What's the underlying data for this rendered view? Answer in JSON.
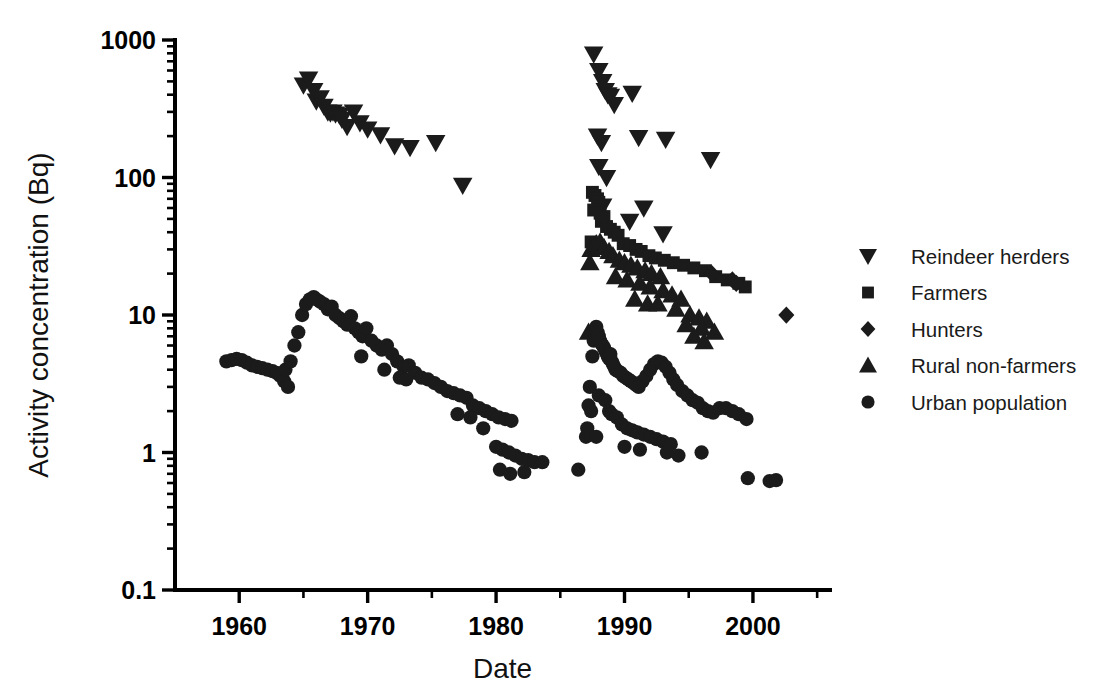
{
  "figure": {
    "background": "#ffffff",
    "ink": "#1b1b1b"
  },
  "axes": {
    "x_title": "Date",
    "y_title": "Activity concentration (Bq)",
    "x_ticklabels": [
      "1960",
      "1970",
      "1980",
      "1990",
      "2000"
    ],
    "y_ticklabels": [
      "0.1",
      "1",
      "10",
      "100",
      "1000"
    ]
  },
  "legend": {
    "position": "right",
    "items": [
      {
        "label": "Reindeer herders",
        "marker": "triangle-down",
        "color": "#1b1b1b"
      },
      {
        "label": "Farmers",
        "marker": "square",
        "color": "#1b1b1b"
      },
      {
        "label": "Hunters",
        "marker": "diamond",
        "color": "#1b1b1b"
      },
      {
        "label": "Rural non-farmers",
        "marker": "triangle-up",
        "color": "#1b1b1b"
      },
      {
        "label": "Urban population",
        "marker": "circle",
        "color": "#1b1b1b"
      }
    ]
  },
  "chart_data": {
    "type": "scatter",
    "title": "",
    "xlabel": "Date",
    "ylabel": "Activity concentration (Bq)",
    "xlim": [
      1955,
      2006
    ],
    "ylim": [
      0.1,
      1000
    ],
    "yscale": "log",
    "xscale": "linear",
    "grid": false,
    "legend_position": "right",
    "x_major_ticks": [
      1960,
      1970,
      1980,
      1990,
      2000
    ],
    "x_minor_ticks": [
      1965,
      1975,
      1985,
      1995,
      2005
    ],
    "y_major_ticks": [
      0.1,
      1,
      10,
      100,
      1000
    ],
    "series": [
      {
        "name": "Reindeer herders",
        "marker": "triangle-down",
        "color": "#1b1b1b",
        "points": [
          [
            1965.0,
            470
          ],
          [
            1965.4,
            520
          ],
          [
            1965.8,
            430
          ],
          [
            1966.0,
            360
          ],
          [
            1966.3,
            380
          ],
          [
            1966.6,
            330
          ],
          [
            1966.9,
            300
          ],
          [
            1967.1,
            295
          ],
          [
            1967.3,
            300
          ],
          [
            1967.5,
            290
          ],
          [
            1967.8,
            285
          ],
          [
            1968.0,
            265
          ],
          [
            1968.4,
            235
          ],
          [
            1968.9,
            300
          ],
          [
            1969.4,
            250
          ],
          [
            1970.0,
            225
          ],
          [
            1971.0,
            205
          ],
          [
            1972.1,
            170
          ],
          [
            1973.3,
            165
          ],
          [
            1975.3,
            180
          ],
          [
            1977.4,
            88
          ],
          [
            1987.6,
            790
          ],
          [
            1988.0,
            600
          ],
          [
            1988.3,
            500
          ],
          [
            1988.5,
            430
          ],
          [
            1988.7,
            400
          ],
          [
            1988.9,
            390
          ],
          [
            1989.2,
            340
          ],
          [
            1990.6,
            410
          ],
          [
            1987.9,
            200
          ],
          [
            1988.2,
            180
          ],
          [
            1991.1,
            195
          ],
          [
            1993.2,
            190
          ],
          [
            1988.0,
            120
          ],
          [
            1988.6,
            100
          ],
          [
            1996.7,
            135
          ],
          [
            1988.3,
            62
          ],
          [
            1991.5,
            60
          ],
          [
            1990.4,
            48
          ],
          [
            1993.0,
            39
          ]
        ]
      },
      {
        "name": "Farmers",
        "marker": "square",
        "color": "#1b1b1b",
        "points": [
          [
            1987.5,
            78
          ],
          [
            1987.7,
            74
          ],
          [
            1987.9,
            70
          ],
          [
            1988.0,
            66
          ],
          [
            1987.6,
            58
          ],
          [
            1988.1,
            55
          ],
          [
            1988.4,
            52
          ],
          [
            1988.2,
            48
          ],
          [
            1988.6,
            44
          ],
          [
            1988.9,
            42
          ],
          [
            1989.2,
            40
          ],
          [
            1989.5,
            38
          ],
          [
            1987.4,
            34
          ],
          [
            1989.9,
            33
          ],
          [
            1990.4,
            32
          ],
          [
            1990.9,
            30
          ],
          [
            1991.3,
            29
          ],
          [
            1991.9,
            27
          ],
          [
            1992.4,
            26
          ],
          [
            1993.1,
            25
          ],
          [
            1993.8,
            24
          ],
          [
            1994.6,
            23
          ],
          [
            1995.4,
            22
          ],
          [
            1996.3,
            21
          ],
          [
            1997.1,
            19
          ],
          [
            1998.0,
            18
          ],
          [
            1998.9,
            17
          ],
          [
            1999.4,
            16
          ]
        ]
      },
      {
        "name": "Hunters",
        "marker": "diamond",
        "color": "#1b1b1b",
        "points": [
          [
            1996.8,
            20
          ],
          [
            1998.4,
            18
          ],
          [
            1998.7,
            17
          ],
          [
            2002.6,
            10
          ]
        ]
      },
      {
        "name": "Rural non-farmers",
        "marker": "triangle-up",
        "color": "#1b1b1b",
        "points": [
          [
            1987.4,
            30
          ],
          [
            1987.8,
            33
          ],
          [
            1988.1,
            34
          ],
          [
            1988.4,
            31
          ],
          [
            1988.8,
            29
          ],
          [
            1989.1,
            27
          ],
          [
            1987.3,
            24
          ],
          [
            1989.6,
            25
          ],
          [
            1990.0,
            24
          ],
          [
            1990.5,
            23
          ],
          [
            1991.0,
            22
          ],
          [
            1991.6,
            21
          ],
          [
            1992.1,
            20
          ],
          [
            1992.8,
            19
          ],
          [
            1989.3,
            19
          ],
          [
            1990.2,
            18
          ],
          [
            1991.2,
            17
          ],
          [
            1992.0,
            16
          ],
          [
            1993.0,
            15
          ],
          [
            1993.7,
            14
          ],
          [
            1994.4,
            13
          ],
          [
            1990.8,
            13
          ],
          [
            1991.8,
            12
          ],
          [
            1992.6,
            12
          ],
          [
            1994.0,
            11
          ],
          [
            1995.1,
            10
          ],
          [
            1995.8,
            9.5
          ],
          [
            1996.4,
            9.0
          ],
          [
            1994.8,
            8.5
          ],
          [
            1996.0,
            8.0
          ],
          [
            1997.0,
            7.5
          ],
          [
            1987.2,
            7.5
          ],
          [
            1995.4,
            7.0
          ],
          [
            1996.2,
            6.4
          ]
        ]
      },
      {
        "name": "Urban population",
        "marker": "circle",
        "color": "#1b1b1b",
        "points": [
          [
            1959.0,
            4.6
          ],
          [
            1959.4,
            4.7
          ],
          [
            1959.8,
            4.8
          ],
          [
            1960.2,
            4.7
          ],
          [
            1960.6,
            4.5
          ],
          [
            1961.0,
            4.3
          ],
          [
            1961.4,
            4.2
          ],
          [
            1961.8,
            4.1
          ],
          [
            1962.2,
            4.0
          ],
          [
            1962.6,
            3.9
          ],
          [
            1962.9,
            3.8
          ],
          [
            1963.2,
            3.6
          ],
          [
            1963.5,
            3.3
          ],
          [
            1963.8,
            3.0
          ],
          [
            1963.6,
            4.0
          ],
          [
            1964.0,
            4.6
          ],
          [
            1964.3,
            6.0
          ],
          [
            1964.6,
            7.5
          ],
          [
            1964.9,
            10.0
          ],
          [
            1965.2,
            12.0
          ],
          [
            1965.5,
            13.0
          ],
          [
            1965.8,
            13.5
          ],
          [
            1966.0,
            13.0
          ],
          [
            1966.3,
            12.5
          ],
          [
            1966.6,
            12.0
          ],
          [
            1966.9,
            11.0
          ],
          [
            1967.2,
            11.5
          ],
          [
            1967.5,
            10.0
          ],
          [
            1967.8,
            9.5
          ],
          [
            1968.1,
            9.0
          ],
          [
            1968.4,
            8.5
          ],
          [
            1968.7,
            9.8
          ],
          [
            1969.0,
            8.0
          ],
          [
            1969.3,
            7.5
          ],
          [
            1969.6,
            7.0
          ],
          [
            1969.9,
            8.0
          ],
          [
            1970.3,
            6.5
          ],
          [
            1970.7,
            6.0
          ],
          [
            1971.1,
            5.6
          ],
          [
            1971.5,
            6.0
          ],
          [
            1971.9,
            5.2
          ],
          [
            1972.3,
            4.6
          ],
          [
            1972.8,
            4.2
          ],
          [
            1973.2,
            4.3
          ],
          [
            1973.7,
            3.8
          ],
          [
            1974.2,
            3.5
          ],
          [
            1974.7,
            3.4
          ],
          [
            1975.2,
            3.2
          ],
          [
            1975.7,
            3.0
          ],
          [
            1976.2,
            2.8
          ],
          [
            1976.7,
            2.7
          ],
          [
            1977.2,
            2.6
          ],
          [
            1977.7,
            2.5
          ],
          [
            1978.2,
            2.2
          ],
          [
            1978.7,
            2.1
          ],
          [
            1979.2,
            2.0
          ],
          [
            1979.7,
            1.9
          ],
          [
            1980.2,
            1.8
          ],
          [
            1980.7,
            1.75
          ],
          [
            1981.2,
            1.7
          ],
          [
            1969.5,
            5.0
          ],
          [
            1971.3,
            4.0
          ],
          [
            1972.5,
            3.5
          ],
          [
            1973.0,
            3.4
          ],
          [
            1977.0,
            1.9
          ],
          [
            1978.0,
            1.8
          ],
          [
            1979.0,
            1.5
          ],
          [
            1980.0,
            1.1
          ],
          [
            1980.5,
            1.05
          ],
          [
            1981.0,
            1.0
          ],
          [
            1981.5,
            0.95
          ],
          [
            1982.0,
            0.9
          ],
          [
            1982.5,
            0.88
          ],
          [
            1983.0,
            0.85
          ],
          [
            1983.6,
            0.85
          ],
          [
            1980.3,
            0.75
          ],
          [
            1981.1,
            0.7
          ],
          [
            1982.2,
            0.72
          ],
          [
            1986.4,
            0.75
          ],
          [
            1987.0,
            1.3
          ],
          [
            1987.3,
            3.0
          ],
          [
            1987.5,
            5.0
          ],
          [
            1987.6,
            6.5
          ],
          [
            1987.7,
            7.8
          ],
          [
            1987.8,
            8.2
          ],
          [
            1987.9,
            7.5
          ],
          [
            1988.0,
            7.0
          ],
          [
            1988.1,
            6.5
          ],
          [
            1988.2,
            6.2
          ],
          [
            1988.3,
            6.0
          ],
          [
            1988.4,
            5.8
          ],
          [
            1988.5,
            5.5
          ],
          [
            1988.6,
            5.3
          ],
          [
            1988.7,
            5.0
          ],
          [
            1988.8,
            4.8
          ],
          [
            1988.9,
            5.2
          ],
          [
            1989.0,
            4.6
          ],
          [
            1989.1,
            4.4
          ],
          [
            1989.2,
            4.2
          ],
          [
            1989.3,
            4.0
          ],
          [
            1989.5,
            3.9
          ],
          [
            1989.7,
            3.8
          ],
          [
            1989.9,
            3.6
          ],
          [
            1990.1,
            3.5
          ],
          [
            1990.3,
            3.4
          ],
          [
            1990.5,
            3.3
          ],
          [
            1990.7,
            3.2
          ],
          [
            1990.9,
            3.1
          ],
          [
            1991.1,
            3.0
          ],
          [
            1991.4,
            3.3
          ],
          [
            1991.7,
            3.6
          ],
          [
            1992.0,
            4.0
          ],
          [
            1992.3,
            4.4
          ],
          [
            1992.6,
            4.6
          ],
          [
            1992.9,
            4.5
          ],
          [
            1993.2,
            4.2
          ],
          [
            1993.5,
            3.8
          ],
          [
            1993.8,
            3.4
          ],
          [
            1994.1,
            3.1
          ],
          [
            1994.5,
            2.8
          ],
          [
            1994.9,
            2.6
          ],
          [
            1995.3,
            2.4
          ],
          [
            1995.7,
            2.3
          ],
          [
            1996.1,
            2.1
          ],
          [
            1996.5,
            2.0
          ],
          [
            1996.9,
            1.95
          ],
          [
            1997.4,
            2.1
          ],
          [
            1997.9,
            2.1
          ],
          [
            1998.4,
            2.0
          ],
          [
            1998.9,
            1.9
          ],
          [
            1999.5,
            1.75
          ],
          [
            1987.2,
            2.2
          ],
          [
            1987.4,
            2.0
          ],
          [
            1988.0,
            2.6
          ],
          [
            1988.5,
            2.4
          ],
          [
            1988.8,
            2.0
          ],
          [
            1989.0,
            1.9
          ],
          [
            1989.4,
            1.8
          ],
          [
            1989.8,
            1.6
          ],
          [
            1990.2,
            1.5
          ],
          [
            1990.6,
            1.45
          ],
          [
            1991.0,
            1.4
          ],
          [
            1991.5,
            1.35
          ],
          [
            1992.0,
            1.3
          ],
          [
            1992.5,
            1.25
          ],
          [
            1993.0,
            1.2
          ],
          [
            1993.6,
            1.15
          ],
          [
            1987.1,
            1.5
          ],
          [
            1987.8,
            1.3
          ],
          [
            1990.0,
            1.1
          ],
          [
            1991.2,
            1.05
          ],
          [
            1993.3,
            1.0
          ],
          [
            1994.2,
            0.95
          ],
          [
            1996.0,
            1.0
          ],
          [
            1999.6,
            0.65
          ],
          [
            2001.3,
            0.62
          ],
          [
            2001.8,
            0.63
          ]
        ]
      }
    ]
  }
}
